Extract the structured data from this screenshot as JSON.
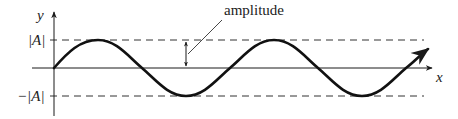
{
  "diagram": {
    "labels": {
      "y_axis": "y",
      "x_axis": "x",
      "upper_level": "|A|",
      "lower_level": "−|A|",
      "annotation": "amplitude"
    },
    "colors": {
      "stroke": "#1a1a1a",
      "curve": "#111111",
      "background": "#ffffff"
    },
    "wave": {
      "type": "sine",
      "cycles_shown": 2.3,
      "starts_at_origin": true
    }
  }
}
